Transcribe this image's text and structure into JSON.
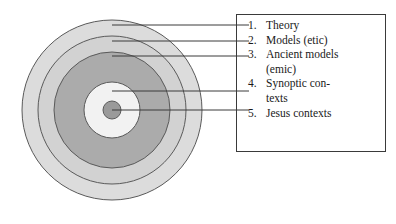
{
  "figure": {
    "background_color": "#ffffff",
    "line_color": "#3a3a3a"
  },
  "diagram": {
    "type": "concentric-circles",
    "center": {
      "x": 112,
      "y": 110
    },
    "rings": [
      {
        "index": 1,
        "name": "theory-ring",
        "radius": 90,
        "fill": "#dcdcdc",
        "label_ref": 1
      },
      {
        "index": 2,
        "name": "models-etic-ring",
        "radius": 74,
        "fill": "#d2d2d2",
        "label_ref": 2
      },
      {
        "index": 3,
        "name": "ancient-models-emic-ring",
        "radius": 58,
        "fill": "#ababab",
        "label_ref": 3
      },
      {
        "index": 4,
        "name": "synoptic-contexts-ring",
        "radius": 28,
        "fill": "#f0f0f0",
        "label_ref": 4
      },
      {
        "index": 5,
        "name": "jesus-contexts-core",
        "radius": 9,
        "fill": "#9a9a9a",
        "label_ref": 5
      }
    ],
    "leader_lines": [
      {
        "ref": 1,
        "x1": 112,
        "y1": 25,
        "x2": 248,
        "y2": 25
      },
      {
        "ref": 2,
        "x1": 112,
        "y1": 41,
        "x2": 248,
        "y2": 41
      },
      {
        "ref": 3,
        "x1": 112,
        "y1": 56,
        "x2": 248,
        "y2": 56
      },
      {
        "ref": 4,
        "x1": 112,
        "y1": 91,
        "x2": 248,
        "y2": 91
      },
      {
        "ref": 5,
        "x1": 112,
        "y1": 110,
        "x2": 248,
        "y2": 110
      }
    ]
  },
  "legend": {
    "items": [
      {
        "number": "1.",
        "label": "Theory"
      },
      {
        "number": "2.",
        "label": "Models (etic)"
      },
      {
        "number": "3.",
        "label": "Ancient models\n(emic)"
      },
      {
        "number": "4.",
        "label": "Synoptic con-\ntexts"
      },
      {
        "number": "5.",
        "label": "Jesus contexts"
      }
    ]
  }
}
